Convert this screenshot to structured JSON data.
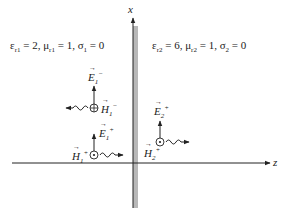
{
  "axes": {
    "vertical_label": "x",
    "horizontal_label": "z"
  },
  "region1": {
    "params": "εr1 = 2, μr1 = 1, σ1 = 0",
    "eps_label": "ε",
    "eps_sub": "r1",
    "eps_val": " = 2, ",
    "mu_label": "μ",
    "mu_sub": "r1",
    "mu_val": " = 1, ",
    "sigma_label": "σ",
    "sigma_sub": "1",
    "sigma_val": " = 0"
  },
  "region2": {
    "params": "εr2 = 6, μr2 = 1, σ2 = 0",
    "eps_label": "ε",
    "eps_sub": "r2",
    "eps_val": " = 6, ",
    "mu_label": "μ",
    "mu_sub": "r2",
    "mu_val": " = 1, ",
    "sigma_label": "σ",
    "sigma_sub": "2",
    "sigma_val": " = 0"
  },
  "fields": {
    "reflected_E": {
      "sym": "E",
      "sub": "1",
      "sup": "−"
    },
    "reflected_H": {
      "sym": "H",
      "sub": "1",
      "sup": "−",
      "marker": "into-page (⊕)"
    },
    "incident_E": {
      "sym": "E",
      "sub": "1",
      "sup": "+"
    },
    "incident_H": {
      "sym": "H",
      "sub": "1",
      "sup": "+",
      "marker": "out-of-page (⊙)"
    },
    "transmitted_E": {
      "sym": "E",
      "sub": "2",
      "sup": "+"
    },
    "transmitted_H": {
      "sym": "H",
      "sub": "2",
      "sup": "+",
      "marker": "out-of-page (⊙)"
    }
  },
  "colors": {
    "ink": "#222222",
    "interface": "#b8b8b8"
  }
}
